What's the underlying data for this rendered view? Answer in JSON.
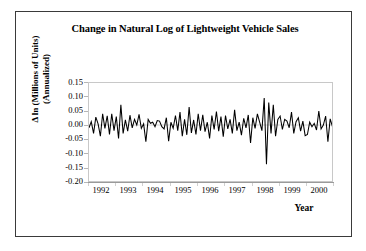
{
  "figure": {
    "title": "Change in Natural Log of Lightweight Vehicle Sales",
    "title_line1": "Change in Natural Log of Lightweight Vehicle",
    "title_line2": "Sales",
    "border_color": "#3a3a3a",
    "background": "#ffffff"
  },
  "axes": {
    "y_title_line1": "Δ ln (Millions of Units)",
    "y_title_line2": "(Annualized)",
    "x_title": "Year",
    "y_ticks": [
      "0.15",
      "0.10",
      "0.05",
      "0.00",
      "-0.05",
      "-0.10",
      "-0.15",
      "-0.20"
    ],
    "x_ticks": [
      "1992",
      "1993",
      "1994",
      "1995",
      "1996",
      "1997",
      "1998",
      "1999",
      "2000"
    ],
    "series_color": "#000000",
    "frame_color": "#c8c8c8"
  },
  "chart_data": {
    "type": "line",
    "title": "Change in Natural Log of Lightweight Vehicle Sales",
    "xlabel": "Year",
    "ylabel": "Δ ln (Millions of Units) (Annualized)",
    "ylim": [
      -0.2,
      0.15
    ],
    "xlim": [
      1992.0,
      2000.9
    ],
    "ytick_values": [
      0.15,
      0.1,
      0.05,
      0.0,
      -0.05,
      -0.1,
      -0.15,
      -0.2
    ],
    "xtick_values": [
      1992,
      1993,
      1994,
      1995,
      1996,
      1997,
      1998,
      1999,
      2000
    ],
    "grid": false,
    "legend": false,
    "frequency": "monthly",
    "x": [
      1992.0,
      1992.083,
      1992.167,
      1992.25,
      1992.333,
      1992.417,
      1992.5,
      1992.583,
      1992.667,
      1992.75,
      1992.833,
      1992.917,
      1993.0,
      1993.083,
      1993.167,
      1993.25,
      1993.333,
      1993.417,
      1993.5,
      1993.583,
      1993.667,
      1993.75,
      1993.833,
      1993.917,
      1994.0,
      1994.083,
      1994.167,
      1994.25,
      1994.333,
      1994.417,
      1994.5,
      1994.583,
      1994.667,
      1994.75,
      1994.833,
      1994.917,
      1995.0,
      1995.083,
      1995.167,
      1995.25,
      1995.333,
      1995.417,
      1995.5,
      1995.583,
      1995.667,
      1995.75,
      1995.833,
      1995.917,
      1996.0,
      1996.083,
      1996.167,
      1996.25,
      1996.333,
      1996.417,
      1996.5,
      1996.583,
      1996.667,
      1996.75,
      1996.833,
      1996.917,
      1997.0,
      1997.083,
      1997.167,
      1997.25,
      1997.333,
      1997.417,
      1997.5,
      1997.583,
      1997.667,
      1997.75,
      1997.833,
      1997.917,
      1998.0,
      1998.083,
      1998.167,
      1998.25,
      1998.333,
      1998.417,
      1998.5,
      1998.583,
      1998.667,
      1998.75,
      1998.833,
      1998.917,
      1999.0,
      1999.083,
      1999.167,
      1999.25,
      1999.333,
      1999.417,
      1999.5,
      1999.583,
      1999.667,
      1999.75,
      1999.833,
      1999.917,
      2000.0,
      2000.083,
      2000.167,
      2000.25,
      2000.333,
      2000.417,
      2000.5,
      2000.583,
      2000.667,
      2000.75,
      2000.833,
      2000.917
    ],
    "values": [
      -0.01,
      0.012,
      -0.03,
      0.028,
      0.004,
      -0.04,
      0.04,
      -0.012,
      0.033,
      -0.034,
      0.04,
      -0.02,
      0.03,
      -0.048,
      0.072,
      -0.03,
      0.018,
      -0.022,
      0.035,
      -0.01,
      0.02,
      0.0,
      0.038,
      -0.012,
      0.004,
      -0.06,
      0.02,
      0.006,
      0.01,
      -0.006,
      0.016,
      0.014,
      -0.006,
      -0.014,
      0.026,
      -0.058,
      0.01,
      -0.012,
      0.034,
      -0.02,
      0.046,
      -0.04,
      0.02,
      -0.035,
      0.064,
      -0.028,
      0.018,
      -0.034,
      0.04,
      -0.02,
      0.036,
      -0.024,
      0.01,
      -0.048,
      0.034,
      -0.016,
      0.048,
      -0.022,
      0.03,
      -0.042,
      0.034,
      -0.014,
      0.02,
      -0.03,
      0.054,
      -0.02,
      0.01,
      -0.036,
      0.024,
      -0.01,
      0.036,
      -0.064,
      0.026,
      -0.012,
      0.04,
      0.01,
      -0.02,
      0.096,
      -0.14,
      0.08,
      -0.03,
      0.072,
      -0.04,
      0.02,
      0.032,
      -0.016,
      0.02,
      0.014,
      -0.01,
      0.046,
      -0.03,
      0.012,
      0.026,
      -0.022,
      0.014,
      -0.038,
      -0.034,
      0.01,
      -0.006,
      0.006,
      -0.018,
      0.05,
      -0.014,
      0.0,
      0.032,
      -0.06,
      0.022,
      -0.006
    ]
  }
}
